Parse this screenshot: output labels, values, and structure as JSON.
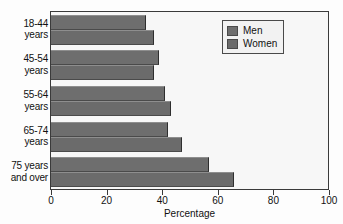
{
  "chart_data": {
    "type": "bar",
    "orientation": "horizontal",
    "title": "",
    "xlabel": "Percentage",
    "ylabel": "",
    "xlim": [
      0,
      100
    ],
    "xticks": [
      0,
      20,
      40,
      60,
      80,
      100
    ],
    "grid": false,
    "legend_position": "top-right",
    "categories": [
      "18-44 years",
      "45-54 years",
      "55-64 years",
      "65-74 years",
      "75 years and over"
    ],
    "category_lines": [
      [
        "18-44",
        "years"
      ],
      [
        "45-54",
        "years"
      ],
      [
        "55-64",
        "years"
      ],
      [
        "65-74",
        "years"
      ],
      [
        "75 years",
        "and over"
      ]
    ],
    "series": [
      {
        "name": "Men",
        "color": "#6e6e6e",
        "values": [
          34,
          39,
          41,
          42,
          57
        ]
      },
      {
        "name": "Women",
        "color": "#6b6b6b",
        "values": [
          37,
          37,
          43,
          47,
          66
        ]
      }
    ]
  },
  "legend": {
    "items": [
      {
        "label": "Men"
      },
      {
        "label": "Women"
      }
    ]
  },
  "axis": {
    "x_title": "Percentage",
    "tick_labels": [
      "0",
      "20",
      "40",
      "60",
      "80",
      "100"
    ]
  },
  "colors": {
    "men_bar": "#6e6e6e",
    "women_bar": "#6b6b6b",
    "frame": "#3a3a3a",
    "plot_background": "#f7f7f7",
    "page_background": "#fdfdfd",
    "text": "#111111"
  }
}
